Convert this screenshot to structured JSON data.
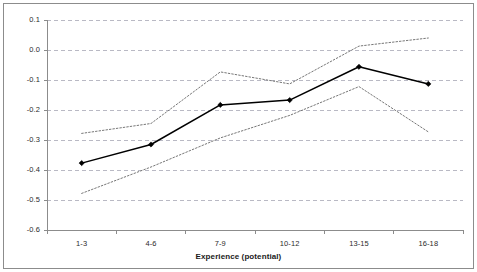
{
  "chart_data": {
    "type": "line",
    "title": "",
    "subtitle": "",
    "xlabel": "Experience (potential)",
    "ylabel": "",
    "categories": [
      "1-3",
      "4-6",
      "7-9",
      "10-12",
      "13-15",
      "16-18"
    ],
    "ylim": [
      -0.6,
      0.1
    ],
    "yticks": [
      0.1,
      0.0,
      -0.1,
      -0.2,
      -0.3,
      -0.4,
      -0.5,
      -0.6
    ],
    "ytick_labels": [
      "0.1",
      "0.0",
      "-0.1",
      "-0.2",
      "-0.3",
      "-0.4",
      "-0.5",
      "-0.6"
    ],
    "grid": true,
    "grid_axis": "y",
    "legend": false,
    "legend_position": "none",
    "series": [
      {
        "name": "estimate",
        "style": "solid",
        "marker": "diamond",
        "color": "#000000",
        "values": [
          -0.377,
          -0.315,
          -0.183,
          -0.167,
          -0.056,
          -0.113
        ]
      },
      {
        "name": "upper confidence bound",
        "style": "dotted",
        "marker": "none",
        "color": "#777777",
        "values": [
          -0.278,
          -0.245,
          -0.073,
          -0.113,
          0.013,
          0.04
        ]
      },
      {
        "name": "lower confidence bound",
        "style": "dotted",
        "marker": "none",
        "color": "#777777",
        "values": [
          -0.478,
          -0.39,
          -0.293,
          -0.218,
          -0.122,
          -0.273
        ]
      }
    ],
    "colors": {
      "series_line": "#000000",
      "confidence_band": "#777777",
      "gridline": "#b9b9c4",
      "axis": "#8c8c8c",
      "border": "#8c8c8c",
      "text": "#2b2b2b",
      "background": "#ffffff"
    }
  }
}
